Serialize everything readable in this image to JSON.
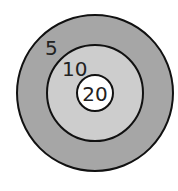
{
  "diagram": {
    "type": "concentric-target",
    "rings": [
      {
        "id": "outer",
        "label": "5",
        "fill": "#a6a6a6",
        "cx": 95,
        "cy": 93,
        "r": 78
      },
      {
        "id": "middle",
        "label": "10",
        "fill": "#cdcdcd",
        "cx": 95,
        "cy": 93,
        "r": 48
      },
      {
        "id": "inner",
        "label": "20",
        "fill": "#ffffff",
        "cx": 95,
        "cy": 93,
        "r": 18
      }
    ],
    "stroke": "#111111"
  }
}
